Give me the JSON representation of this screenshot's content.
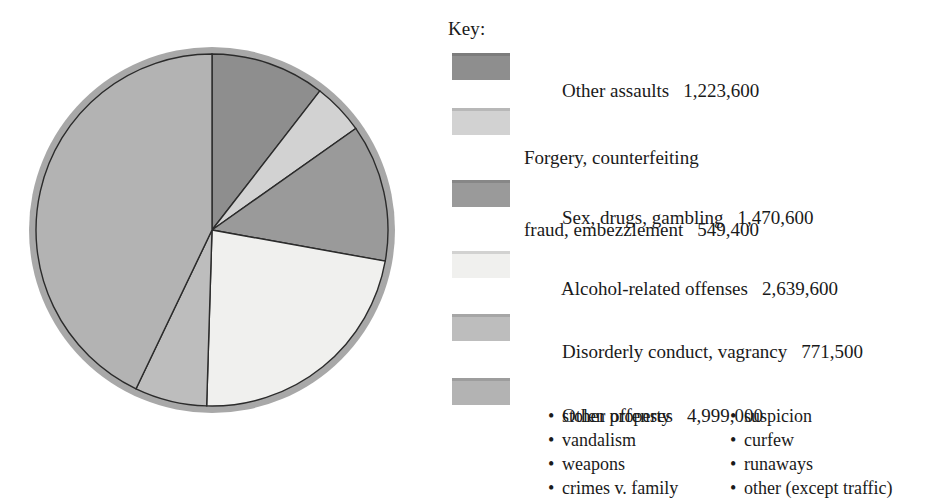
{
  "legend": {
    "key_label": "Key:"
  },
  "chart_data": {
    "type": "pie",
    "title": "",
    "xlabel": "",
    "ylabel": "",
    "legend_position": "right",
    "grid": false,
    "start_angle_deg": 0,
    "direction": "clockwise",
    "total": 11653700,
    "categories": [
      "Other assaults",
      "Forgery, counterfeiting\nfraud, embezzlement",
      "Sex, drugs, gambling",
      "Alcohol-related offenses",
      "Disorderly conduct, vagrancy",
      "Other offenses"
    ],
    "values": [
      1223600,
      549400,
      1470600,
      2639600,
      771500,
      4999000
    ],
    "value_labels": [
      "1,223,600",
      "549,400",
      "1,470,600",
      "2,639,600",
      "771,500",
      "4,999,000"
    ],
    "colors": [
      "#8e8e8e",
      "#d2d2d2",
      "#9a9a9a",
      "#f0f0ee",
      "#bdbdbd",
      "#b3b3b3"
    ],
    "slices": [
      {
        "label": "Other assaults",
        "label_line1": "Other assaults",
        "label_line2": "",
        "value": 1223600,
        "value_label": "1,223,600",
        "percent": 10.5,
        "color": "#8e8e8e"
      },
      {
        "label": "Forgery, counterfeiting fraud, embezzlement",
        "label_line1": "Forgery, counterfeiting",
        "label_line2": "fraud, embezzlement",
        "value": 549400,
        "value_label": "549,400",
        "percent": 4.7,
        "color": "#d2d2d2"
      },
      {
        "label": "Sex, drugs, gambling",
        "label_line1": "Sex, drugs, gambling",
        "label_line2": "",
        "value": 1470600,
        "value_label": "1,470,600",
        "percent": 12.6,
        "color": "#9a9a9a"
      },
      {
        "label": "Alcohol-related offenses",
        "label_line1": "Alcohol-related offenses",
        "label_line2": "",
        "value": 2639600,
        "value_label": "2,639,600",
        "percent": 22.7,
        "color": "#f0f0ee"
      },
      {
        "label": "Disorderly conduct, vagrancy",
        "label_line1": "Disorderly conduct, vagrancy",
        "label_line2": "",
        "value": 771500,
        "value_label": "771,500",
        "percent": 6.6,
        "color": "#bdbdbd"
      },
      {
        "label": "Other offenses",
        "label_line1": "Other offenses",
        "label_line2": "",
        "value": 4999000,
        "value_label": "4,999,000",
        "percent": 42.9,
        "color": "#b3b3b3"
      }
    ],
    "annotations": {
      "other_offenses_sublist": [
        [
          "stolen property",
          "suspicion"
        ],
        [
          "vandalism",
          "curfew"
        ],
        [
          "weapons",
          "runaways"
        ],
        [
          "crimes v. family",
          "other (except traffic)"
        ]
      ],
      "bullet_char": "•"
    },
    "style": {
      "ring_color": "#a8a8a8",
      "slice_outline": "#2b2b2b",
      "background": "#ffffff"
    }
  }
}
